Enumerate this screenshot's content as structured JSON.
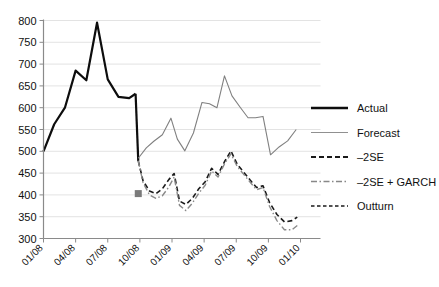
{
  "chart_data": {
    "type": "line",
    "title": "",
    "subtitle": "",
    "xlabel": "",
    "ylabel": "",
    "grid": "horizontal",
    "legend_position": "right",
    "xlim": [
      0,
      24
    ],
    "ylim": [
      300,
      800
    ],
    "ytick_values": [
      300,
      350,
      400,
      450,
      500,
      550,
      600,
      650,
      700,
      750,
      800
    ],
    "ytick_labels": [
      "300",
      "350",
      "400",
      "450",
      "500",
      "550",
      "600",
      "650",
      "700",
      "750",
      "800"
    ],
    "xtick_positions": [
      0,
      3,
      6,
      9,
      12,
      15,
      18,
      21,
      24
    ],
    "xtick_labels": [
      "01/08",
      "04/08",
      "07/08",
      "10/08",
      "01/09",
      "04/09",
      "07/09",
      "10/09",
      "01/10"
    ],
    "marker": {
      "name": "anchor-marker",
      "x": 8.85,
      "y": 403,
      "color": "#7a7a7a",
      "size": 7
    },
    "series": [
      {
        "name": "Actual",
        "style": "solid",
        "color": "#0d0d0d",
        "width": 2.2,
        "x": [
          0,
          1,
          2,
          3,
          4,
          5,
          6,
          7,
          8,
          8.6
        ],
        "values": [
          500,
          562,
          600,
          685,
          663,
          795,
          665,
          625,
          622,
          632
        ]
      },
      {
        "name": "Actual-drop",
        "style": "solid",
        "color": "#0d0d0d",
        "width": 2.2,
        "x": [
          8.6,
          8.85
        ],
        "values": [
          632,
          478
        ]
      },
      {
        "name": "Forecast",
        "style": "solid",
        "color": "#808080",
        "width": 1.1,
        "x": [
          8.85,
          9.6,
          10.3,
          11.1,
          11.9,
          12.5,
          13.2,
          14.0,
          14.8,
          15.5,
          16.2,
          16.9,
          17.6,
          18.4,
          19.1,
          19.8,
          20.5,
          21.2,
          22.0,
          22.8,
          23.6
        ],
        "values": [
          484,
          508,
          523,
          538,
          576,
          528,
          501,
          542,
          612,
          609,
          600,
          673,
          627,
          600,
          577,
          577,
          580,
          492,
          510,
          524,
          550
        ]
      },
      {
        "name": "-2SE",
        "style": "dashed",
        "color": "#1a1a1a",
        "width": 1.6,
        "x": [
          8.85,
          9.3,
          9.9,
          10.5,
          11.1,
          11.7,
          12.2,
          12.7,
          13.3,
          13.9,
          14.5,
          15.1,
          15.7,
          16.3,
          16.9,
          17.5,
          18.1,
          18.7,
          19.3,
          19.9,
          20.5,
          21.1,
          21.8,
          22.5,
          23.2,
          23.7
        ],
        "values": [
          478,
          432,
          409,
          403,
          414,
          435,
          449,
          386,
          378,
          392,
          414,
          430,
          461,
          447,
          476,
          501,
          470,
          452,
          434,
          417,
          421,
          383,
          355,
          338,
          341,
          349
        ]
      },
      {
        "name": "-2SE + GARCH",
        "style": "dashdot",
        "color": "#8a8a8a",
        "width": 1.4,
        "x": [
          8.85,
          9.3,
          9.9,
          10.5,
          11.1,
          11.7,
          12.2,
          12.7,
          13.3,
          13.9,
          14.5,
          15.1,
          15.7,
          16.3,
          16.9,
          17.5,
          18.1,
          18.7,
          19.3,
          19.9,
          20.5,
          21.1,
          21.8,
          22.5,
          23.2,
          23.7
        ],
        "values": [
          478,
          428,
          400,
          392,
          398,
          418,
          441,
          376,
          364,
          381,
          404,
          422,
          455,
          441,
          471,
          494,
          465,
          447,
          429,
          412,
          417,
          374,
          341,
          320,
          320,
          330
        ]
      },
      {
        "name": "Outturn",
        "style": "dotted-short",
        "color": "#1a1a1a",
        "width": 1.3,
        "x": [],
        "values": []
      }
    ],
    "legend": [
      {
        "label": "Actual",
        "style": "solid",
        "color": "#0d0d0d",
        "width": 2.6
      },
      {
        "label": "Forecast",
        "style": "solid",
        "color": "#909090",
        "width": 1.2
      },
      {
        "label": "–2SE",
        "style": "dashed",
        "color": "#1a1a1a",
        "width": 1.8
      },
      {
        "label": "–2SE + GARCH",
        "style": "dashdot",
        "color": "#888888",
        "width": 1.6
      },
      {
        "label": "Outturn",
        "style": "dotted-short",
        "color": "#1a1a1a",
        "width": 1.5
      }
    ]
  },
  "colors": {
    "background": "#ffffff",
    "grid": "#d7d7d7",
    "axis": "#8a8a8a",
    "text": "#111111"
  }
}
